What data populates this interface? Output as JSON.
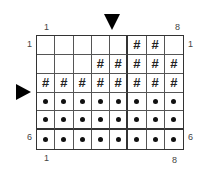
{
  "chart": {
    "col_labels_top": {
      "first": "1",
      "last": "8"
    },
    "col_labels_bottom": {
      "first": "1",
      "last": "8"
    },
    "row_labels_left": {
      "first": "1",
      "last": "6"
    },
    "row_labels_right": {
      "first": "1",
      "last": "6"
    },
    "markers": {
      "top_arrow": "down-triangle",
      "left_arrow": "right-triangle"
    },
    "symbols": {
      "hash": "#",
      "dot": "•",
      "empty": ""
    },
    "rows": [
      [
        "",
        "",
        "",
        "",
        "",
        "#",
        "#",
        ""
      ],
      [
        "",
        "",
        "",
        "#",
        "#",
        "#",
        "#",
        "#"
      ],
      [
        "#",
        "#",
        "#",
        "#",
        "#",
        "#",
        "#",
        "#"
      ],
      [
        "•",
        "•",
        "•",
        "•",
        "•",
        "•",
        "•",
        "•"
      ],
      [
        "•",
        "•",
        "•",
        "•",
        "•",
        "•",
        "•",
        "•"
      ],
      [
        "•",
        "•",
        "•",
        "•",
        "•",
        "•",
        "•",
        "•"
      ]
    ]
  }
}
